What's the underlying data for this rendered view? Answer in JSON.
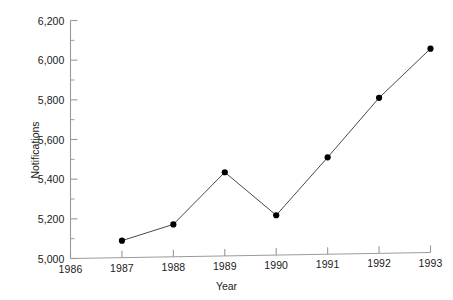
{
  "chart_data": {
    "type": "line",
    "title": "",
    "subtitle": "",
    "xlabel": "Year",
    "ylabel": "Notifications",
    "x": [
      1987,
      1988,
      1989,
      1990,
      1991,
      1992,
      1993
    ],
    "values": [
      5090,
      5172,
      5435,
      5218,
      5510,
      5810,
      6058
    ],
    "series": [
      {
        "name": "Notifications",
        "values": [
          5090,
          5172,
          5435,
          5218,
          5510,
          5810,
          6058
        ]
      }
    ],
    "xlim": [
      1986,
      1993
    ],
    "ylim": [
      5000,
      6200
    ],
    "x_tick_labels": [
      "1986",
      "1987",
      "1988",
      "1989",
      "1990",
      "1991",
      "1992",
      "1993"
    ],
    "x_tick_values": [
      1986,
      1987,
      1988,
      1989,
      1990,
      1991,
      1992,
      1993
    ],
    "y_tick_labels": [
      "5,000",
      "5,200",
      "5,400",
      "5,600",
      "5,800",
      "6,000",
      "6,200"
    ],
    "y_tick_values": [
      5000,
      5200,
      5400,
      5600,
      5800,
      6000,
      6200
    ],
    "y_minor_tick_values": [
      5100,
      5300,
      5500,
      5700,
      5900,
      6100
    ],
    "grid": false,
    "legend": false,
    "legend_position": "none",
    "marker": "filled-circle",
    "line_color": "#4a4a4a",
    "marker_color": "#000000",
    "axis_color": "#9a9a9a",
    "text_color": "#1a1a1a",
    "background_color": "#ffffff"
  }
}
